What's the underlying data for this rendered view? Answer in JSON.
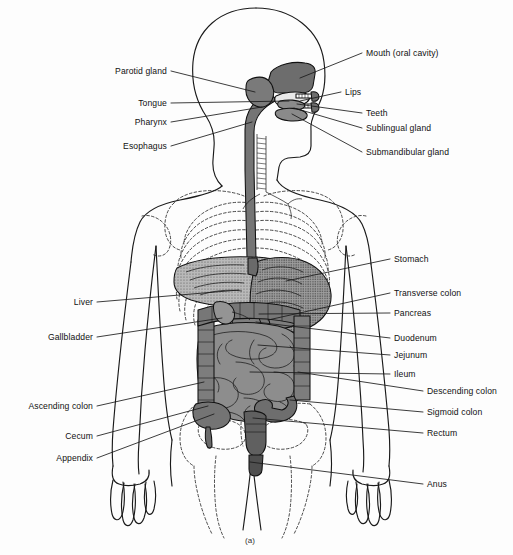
{
  "figure": {
    "caption": "(a)",
    "width": 513,
    "height": 555
  },
  "colors": {
    "background": "#fdfdfd",
    "ink": "#1a1a1a",
    "organ_dark": "#6f6f6f",
    "organ_mid": "#8a8a8a",
    "organ_light": "#a8a8a8",
    "organ_pale": "#bcbcbc",
    "bone_dash": "#2a2a2a"
  },
  "labels_left": [
    {
      "id": "parotid-gland",
      "text": "Parotid gland",
      "tx": 167,
      "ty": 74,
      "px": 255,
      "py": 92
    },
    {
      "id": "tongue",
      "text": "Tongue",
      "tx": 167,
      "ty": 106,
      "px": 289,
      "py": 101
    },
    {
      "id": "pharynx",
      "text": "Pharynx",
      "tx": 167,
      "ty": 125,
      "px": 262,
      "py": 107
    },
    {
      "id": "esophagus",
      "text": "Esophagus",
      "tx": 167,
      "ty": 149,
      "px": 252,
      "py": 122
    },
    {
      "id": "liver",
      "text": "Liver",
      "tx": 93,
      "ty": 305,
      "px": 239,
      "py": 290
    },
    {
      "id": "gallbladder",
      "text": "Gallbladder",
      "tx": 93,
      "ty": 340,
      "px": 222,
      "py": 318
    },
    {
      "id": "ascending-colon",
      "text": "Ascending colon",
      "tx": 93,
      "ty": 409,
      "px": 204,
      "py": 382
    },
    {
      "id": "cecum",
      "text": "Cecum",
      "tx": 93,
      "ty": 439,
      "px": 208,
      "py": 406
    },
    {
      "id": "appendix",
      "text": "Appendix",
      "tx": 93,
      "ty": 461,
      "px": 214,
      "py": 414
    }
  ],
  "labels_right": [
    {
      "id": "mouth-oral-cavity",
      "text": "Mouth (oral cavity)",
      "tx": 366,
      "ty": 56,
      "px": 300,
      "py": 78
    },
    {
      "id": "lips",
      "text": "Lips",
      "tx": 345,
      "ty": 95,
      "px": 300,
      "py": 101
    },
    {
      "id": "teeth",
      "text": "Teeth",
      "tx": 366,
      "ty": 116,
      "px": 297,
      "py": 104
    },
    {
      "id": "sublingual-gland",
      "text": "Sublingual gland",
      "tx": 366,
      "ty": 131,
      "px": 294,
      "py": 108
    },
    {
      "id": "submandibular-gland",
      "text": "Submandibular gland",
      "tx": 366,
      "ty": 155,
      "px": 292,
      "py": 114
    },
    {
      "id": "stomach",
      "text": "Stomach",
      "tx": 394,
      "ty": 262,
      "px": 286,
      "py": 281
    },
    {
      "id": "transverse-colon",
      "text": "Transverse colon",
      "tx": 394,
      "ty": 296,
      "px": 268,
      "py": 320
    },
    {
      "id": "pancreas",
      "text": "Pancreas",
      "tx": 394,
      "ty": 316,
      "px": 259,
      "py": 314
    },
    {
      "id": "duodenum",
      "text": "Duodenum",
      "tx": 394,
      "ty": 341,
      "px": 256,
      "py": 322
    },
    {
      "id": "jejunum",
      "text": "Jejunum",
      "tx": 394,
      "ty": 358,
      "px": 258,
      "py": 345
    },
    {
      "id": "ileum",
      "text": "Ileum",
      "tx": 394,
      "ty": 377,
      "px": 250,
      "py": 372
    },
    {
      "id": "descending-colon",
      "text": "Descending colon",
      "tx": 427,
      "ty": 394,
      "px": 298,
      "py": 372
    },
    {
      "id": "sigmoid-colon",
      "text": "Sigmoid colon",
      "tx": 427,
      "ty": 415,
      "px": 290,
      "py": 400
    },
    {
      "id": "rectum",
      "text": "Rectum",
      "tx": 427,
      "ty": 436,
      "px": 253,
      "py": 418
    },
    {
      "id": "anus",
      "text": "Anus",
      "tx": 427,
      "ty": 487,
      "px": 250,
      "py": 462
    }
  ],
  "organs": [
    {
      "id": "oral-cavity",
      "name": "Mouth (oral cavity)"
    },
    {
      "id": "tongue",
      "name": "Tongue"
    },
    {
      "id": "teeth",
      "name": "Teeth"
    },
    {
      "id": "parotid-gland",
      "name": "Parotid gland"
    },
    {
      "id": "sublingual",
      "name": "Sublingual gland"
    },
    {
      "id": "submandibular",
      "name": "Submandibular gland"
    },
    {
      "id": "pharynx",
      "name": "Pharynx"
    },
    {
      "id": "esophagus",
      "name": "Esophagus"
    },
    {
      "id": "stomach",
      "name": "Stomach"
    },
    {
      "id": "liver",
      "name": "Liver"
    },
    {
      "id": "gallbladder",
      "name": "Gallbladder"
    },
    {
      "id": "pancreas",
      "name": "Pancreas"
    },
    {
      "id": "duodenum",
      "name": "Duodenum"
    },
    {
      "id": "jejunum",
      "name": "Jejunum"
    },
    {
      "id": "ileum",
      "name": "Ileum"
    },
    {
      "id": "ascending-colon",
      "name": "Ascending colon"
    },
    {
      "id": "transverse-colon",
      "name": "Transverse colon"
    },
    {
      "id": "descending-colon",
      "name": "Descending colon"
    },
    {
      "id": "sigmoid-colon",
      "name": "Sigmoid colon"
    },
    {
      "id": "cecum",
      "name": "Cecum"
    },
    {
      "id": "appendix",
      "name": "Appendix"
    },
    {
      "id": "rectum",
      "name": "Rectum"
    },
    {
      "id": "anus",
      "name": "Anus"
    }
  ]
}
